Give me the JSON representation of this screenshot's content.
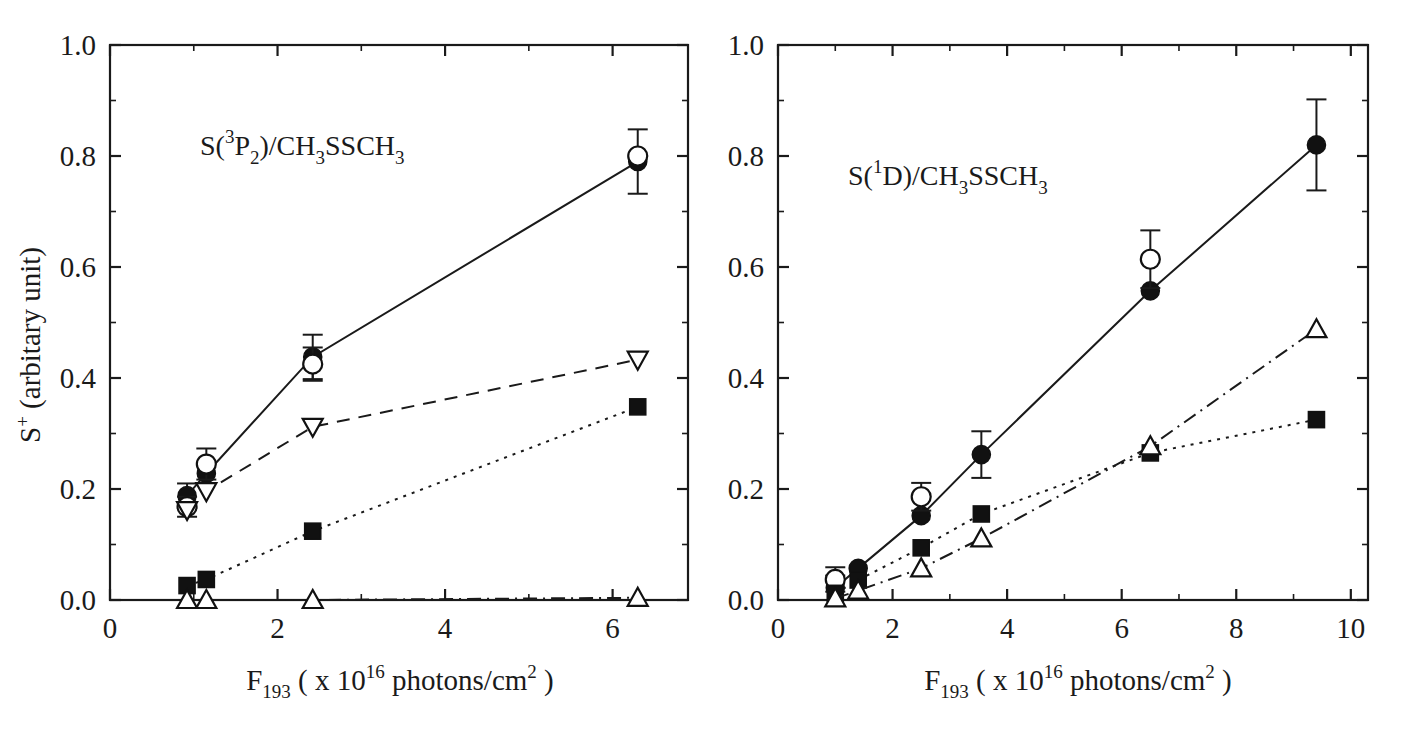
{
  "figure": {
    "title": "",
    "panels": [
      "left",
      "right"
    ]
  },
  "axes": {
    "xlabel_main": "F",
    "xlabel_sub": "193",
    "xlabel_rest_a": " ( x 10",
    "xlabel_sup": "16",
    "xlabel_rest_b": " photons/cm",
    "xlabel_sup2": "2",
    "xlabel_rest_c": " )",
    "ylabel_main": "S",
    "ylabel_sup": "+",
    "ylabel_rest": " (arbitary unit)"
  },
  "left_panel": {
    "annotation": {
      "s": "S(",
      "sup": "3",
      "p": "P",
      "sub1": "2",
      "mid": ")/CH",
      "sub2": "3",
      "ss": "SSCH",
      "sub3": "3"
    },
    "y_ticks": [
      "0.0",
      "0.2",
      "0.4",
      "0.6",
      "0.8",
      "1.0"
    ],
    "x_ticks": [
      "0",
      "2",
      "4",
      "6"
    ]
  },
  "right_panel": {
    "annotation": {
      "s": "S(",
      "sup": "1",
      "p": "D",
      "mid": ")/CH",
      "sub2": "3",
      "ss": "SSCH",
      "sub3": "3"
    },
    "y_ticks": [
      "0.0",
      "0.2",
      "0.4",
      "0.6",
      "0.8",
      "1.0"
    ],
    "x_ticks": [
      "0",
      "2",
      "4",
      "6",
      "8",
      "10"
    ]
  },
  "chart_data": [
    {
      "panel": "left",
      "type": "line",
      "title": "S(3P2)/CH3SSCH3",
      "xlabel": "F193 ( x 10^16 photons/cm^2 )",
      "ylabel": "S+ (arbitary unit)",
      "xlim": [
        0,
        6.9
      ],
      "ylim": [
        0.0,
        1.0
      ],
      "x_ticks": [
        0,
        2,
        4,
        6
      ],
      "y_ticks": [
        0.0,
        0.2,
        0.4,
        0.6,
        0.8,
        1.0
      ],
      "grid": false,
      "legend": "none",
      "series": [
        {
          "name": "filled-circle",
          "marker": "filled-circle",
          "linestyle": "solid",
          "x": [
            0.92,
            1.15,
            2.42,
            6.3
          ],
          "y": [
            0.188,
            0.228,
            0.438,
            0.79
          ],
          "yerr": [
            0.022,
            0.0,
            0.04,
            0.058
          ]
        },
        {
          "name": "open-circle",
          "marker": "open-circle",
          "linestyle": "none",
          "x": [
            0.92,
            1.15,
            2.42,
            6.3
          ],
          "y": [
            0.168,
            0.245,
            0.425,
            0.8
          ],
          "yerr": [
            0.018,
            0.028,
            0.03,
            0.0
          ]
        },
        {
          "name": "open-down-triangle",
          "marker": "open-down-triangle",
          "linestyle": "dashed",
          "x": [
            0.92,
            1.15,
            2.42,
            6.3
          ],
          "y": [
            0.162,
            0.196,
            0.312,
            0.433
          ],
          "yerr": [
            0,
            0,
            0,
            0
          ]
        },
        {
          "name": "filled-square",
          "marker": "filled-square",
          "linestyle": "dotted",
          "x": [
            0.92,
            1.15,
            2.42,
            6.3
          ],
          "y": [
            0.026,
            0.037,
            0.124,
            0.348
          ],
          "yerr": [
            0,
            0,
            0,
            0
          ]
        },
        {
          "name": "open-up-triangle",
          "marker": "open-up-triangle",
          "linestyle": "dashdot",
          "x": [
            0.92,
            1.15,
            2.42,
            6.3
          ],
          "y": [
            0.0,
            0.0,
            0.0,
            0.004
          ],
          "yerr": [
            0,
            0,
            0,
            0
          ]
        }
      ]
    },
    {
      "panel": "right",
      "type": "line",
      "title": "S(1D)/CH3SSCH3",
      "xlabel": "F193 ( x 10^16 photons/cm^2 )",
      "ylabel": "S+ (arbitary unit)",
      "xlim": [
        0,
        10.3
      ],
      "ylim": [
        0.0,
        1.0
      ],
      "x_ticks": [
        0,
        2,
        4,
        6,
        8,
        10
      ],
      "y_ticks": [
        0.0,
        0.2,
        0.4,
        0.6,
        0.8,
        1.0
      ],
      "grid": false,
      "legend": "none",
      "series": [
        {
          "name": "filled-circle",
          "marker": "filled-circle",
          "linestyle": "solid",
          "x": [
            1.0,
            1.4,
            2.5,
            3.55,
            6.5,
            9.4
          ],
          "y": [
            0.022,
            0.057,
            0.152,
            0.262,
            0.557,
            0.82
          ],
          "yerr": [
            0.022,
            0.0,
            0.0,
            0.042,
            0.0,
            0.082
          ]
        },
        {
          "name": "open-circle",
          "marker": "open-circle",
          "linestyle": "none",
          "x": [
            1.0,
            2.5,
            6.5
          ],
          "y": [
            0.037,
            0.186,
            0.614
          ],
          "yerr": [
            0.022,
            0.025,
            0.052
          ]
        },
        {
          "name": "filled-square",
          "marker": "filled-square",
          "linestyle": "dotted",
          "x": [
            1.0,
            1.4,
            2.5,
            3.55,
            6.5,
            9.4
          ],
          "y": [
            0.012,
            0.036,
            0.094,
            0.155,
            0.265,
            0.325
          ],
          "yerr": [
            0,
            0,
            0,
            0,
            0,
            0
          ]
        },
        {
          "name": "open-up-triangle",
          "marker": "open-up-triangle",
          "linestyle": "dashdot",
          "x": [
            1.0,
            1.4,
            2.5,
            3.55,
            6.5,
            9.4
          ],
          "y": [
            0.003,
            0.017,
            0.057,
            0.111,
            0.277,
            0.488
          ],
          "yerr": [
            0,
            0,
            0,
            0,
            0,
            0
          ]
        }
      ]
    }
  ]
}
